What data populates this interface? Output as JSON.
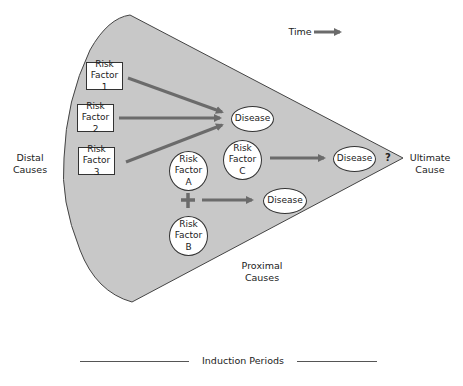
{
  "time": {
    "label": "Time"
  },
  "regions": {
    "distal": {
      "line1": "Distal",
      "line2": "Causes"
    },
    "proximal": {
      "line1": "Proximal",
      "line2": "Causes"
    },
    "ultimate": {
      "line1": "Ultimate",
      "line2": "Cause"
    }
  },
  "risk_factors_boxes": [
    {
      "line1": "Risk",
      "line2": "Factor 1"
    },
    {
      "line1": "Risk",
      "line2": "Factor 2"
    },
    {
      "line1": "Risk",
      "line2": "Factor 3"
    }
  ],
  "risk_factors_circles": {
    "a": {
      "line1": "Risk",
      "line2": "Factor",
      "line3": "A"
    },
    "b": {
      "line1": "Risk",
      "line2": "Factor",
      "line3": "B"
    },
    "c": {
      "line1": "Risk",
      "line2": "Factor",
      "line3": "C"
    }
  },
  "diseases": [
    {
      "label": "Disease"
    },
    {
      "label": "Disease"
    },
    {
      "label": "Disease"
    }
  ],
  "plus": {
    "symbol": "+"
  },
  "unknown": {
    "symbol": "?"
  },
  "footer": {
    "label": "Induction Periods"
  },
  "colors": {
    "cone_fill": "#c8c8c8",
    "arrow": "#6b6b6b",
    "outline": "#333333"
  }
}
